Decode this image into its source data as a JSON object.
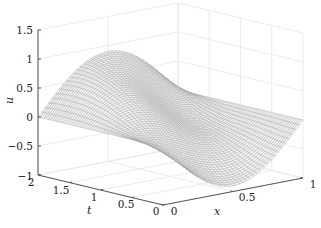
{
  "chart_data": {
    "type": "surface",
    "title": "",
    "xlabel": "x",
    "ylabel": "t",
    "zlabel": "u",
    "x_range": [
      0,
      1
    ],
    "t_range": [
      0,
      2
    ],
    "z_range": [
      -1,
      1.5
    ],
    "x_ticks": [
      "0",
      "0.5",
      "1"
    ],
    "t_ticks": [
      "0",
      "0.5",
      "1",
      "1.5",
      "2"
    ],
    "z_ticks": [
      "-1",
      "-0.5",
      "0",
      "0.5",
      "1",
      "1.5"
    ],
    "grid": true,
    "legend": null,
    "surface_description": "Mesh surface u(x,t) vanishing at x=0 and x=1; dips to about -0.9 near t=0, rises to a hump of about 1.2 near t=2, and a second ridge toward x=1 around t=1",
    "mesh_color": "#9a9a9a"
  }
}
